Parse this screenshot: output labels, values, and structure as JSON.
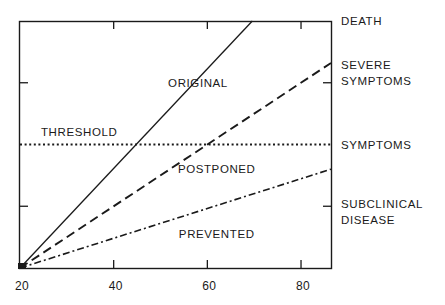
{
  "chart_data": {
    "type": "line",
    "title": "",
    "xlabel": "",
    "ylabel": "",
    "xlim": [
      20,
      86.4
    ],
    "ylim": [
      0,
      4
    ],
    "x_ticks": [
      20,
      40,
      60,
      80
    ],
    "x_tick_labels": [
      "20",
      "40",
      "60",
      "80"
    ],
    "y_ticks": [
      1,
      3
    ],
    "right_axis_labels": [
      {
        "y": 4,
        "lines": [
          "DEATH"
        ]
      },
      {
        "y": 3.15,
        "lines": [
          "SEVERE",
          "SYMPTOMS"
        ]
      },
      {
        "y": 2,
        "lines": [
          "SYMPTOMS"
        ]
      },
      {
        "y": 0.9,
        "lines": [
          "SUBCLINICAL",
          "DISEASE"
        ]
      }
    ],
    "threshold": {
      "label": "THRESHOLD",
      "y": 2,
      "style": "dotted"
    },
    "series": [
      {
        "name": "ORIGINAL",
        "style": "solid",
        "x": [
          20,
          69.6
        ],
        "y": [
          0,
          4
        ]
      },
      {
        "name": "POSTPONED",
        "style": "dashed",
        "x": [
          20,
          86.4
        ],
        "y": [
          0,
          3.32
        ]
      },
      {
        "name": "PREVENTED",
        "style": "dash-dot",
        "x": [
          20,
          86.4
        ],
        "y": [
          0,
          1.6
        ]
      }
    ],
    "region_labels": [
      {
        "text": "ORIGINAL",
        "x": 58,
        "y": 3.0
      },
      {
        "text": "POSTPONED",
        "x": 62,
        "y": 1.6
      },
      {
        "text": "PREVENTED",
        "x": 62,
        "y": 0.55
      }
    ],
    "grid": false,
    "legend": "none"
  }
}
